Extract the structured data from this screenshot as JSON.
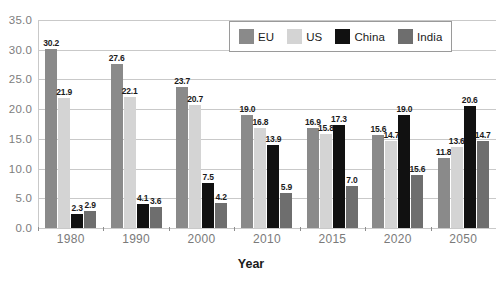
{
  "chart_data": {
    "type": "bar",
    "title": "",
    "xlabel": "Year",
    "ylabel": "",
    "categories": [
      "1980",
      "1990",
      "2000",
      "2010",
      "2015",
      "2020",
      "2050"
    ],
    "series": [
      {
        "name": "EU",
        "color": "#8a8a8a",
        "values": [
          30.2,
          27.6,
          23.7,
          19.0,
          16.9,
          15.6,
          11.8
        ]
      },
      {
        "name": "US",
        "color": "#d4d4d4",
        "values": [
          21.9,
          22.1,
          20.7,
          16.8,
          15.8,
          14.7,
          13.6
        ]
      },
      {
        "name": "China",
        "color": "#111111",
        "values": [
          2.3,
          4.1,
          7.5,
          13.9,
          17.3,
          19.0,
          20.6
        ]
      },
      {
        "name": "India",
        "color": "#6e6e6e",
        "values": [
          2.9,
          3.6,
          4.2,
          5.9,
          7.0,
          15.6,
          14.7
        ]
      }
    ],
    "bar_pixel_values": [
      [
        30.2,
        21.9,
        2.3,
        2.9
      ],
      [
        27.6,
        22.1,
        4.1,
        3.6
      ],
      [
        23.7,
        20.7,
        7.5,
        4.2
      ],
      [
        19.0,
        16.8,
        13.9,
        5.9
      ],
      [
        16.9,
        15.8,
        17.3,
        7.0
      ],
      [
        15.6,
        14.7,
        19.0,
        8.9
      ],
      [
        11.8,
        13.6,
        20.6,
        14.7
      ]
    ],
    "yticks": [
      "35.0",
      "30.0",
      "25.0",
      "20.0",
      "15.0",
      "10.0",
      "5.0",
      "0.0"
    ],
    "ytick_values": [
      35,
      30,
      25,
      20,
      15,
      10,
      5,
      0
    ],
    "ylim": [
      0,
      35
    ],
    "grid": true,
    "legend_position": "top-center"
  }
}
